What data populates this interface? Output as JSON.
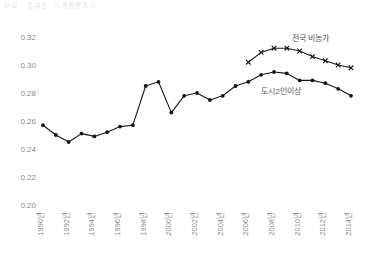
{
  "top_strip": {
    "text": "자료 : 통계청, 가계동향조사"
  },
  "chart_data": {
    "type": "line",
    "title": "",
    "xlabel": "",
    "ylabel": "",
    "ylim": [
      0.2,
      0.32
    ],
    "yticks": [
      0.2,
      0.22,
      0.24,
      0.26,
      0.28,
      0.3,
      0.32
    ],
    "ytick_labels": [
      "0.20",
      "0.22",
      "0.24",
      "0.26",
      "0.28",
      "0.30",
      "0.32"
    ],
    "x": [
      1990,
      1991,
      1992,
      1993,
      1994,
      1995,
      1996,
      1997,
      1998,
      1999,
      2000,
      2001,
      2002,
      2003,
      2004,
      2005,
      2006,
      2007,
      2008,
      2009,
      2010,
      2011,
      2012,
      2013,
      2014
    ],
    "xticks": [
      1990,
      1992,
      1994,
      1996,
      1998,
      2000,
      2002,
      2004,
      2006,
      2008,
      2010,
      2012,
      2014
    ],
    "xtick_labels": [
      "1990년",
      "1992년",
      "1994년",
      "1996년",
      "1998년",
      "2000년",
      "2002년",
      "2004년",
      "2006년",
      "2008년",
      "2010년",
      "2012년",
      "2014년"
    ],
    "grid": false,
    "legend_position": "inline-annotation",
    "series": [
      {
        "name": "도시2인이상",
        "marker": "circle",
        "annotation_x": 2007,
        "annotation_y": 0.2795,
        "x": [
          1990,
          1991,
          1992,
          1993,
          1994,
          1995,
          1996,
          1997,
          1998,
          1999,
          2000,
          2001,
          2002,
          2003,
          2004,
          2005,
          2006,
          2007,
          2008,
          2009,
          2010,
          2011,
          2012,
          2013,
          2014
        ],
        "values": [
          0.257,
          0.25,
          0.245,
          0.251,
          0.249,
          0.252,
          0.256,
          0.257,
          0.285,
          0.288,
          0.266,
          0.278,
          0.28,
          0.275,
          0.278,
          0.285,
          0.288,
          0.293,
          0.295,
          0.294,
          0.289,
          0.289,
          0.287,
          0.283,
          0.278
        ]
      },
      {
        "name": "전국 비농가",
        "marker": "cross",
        "annotation_x": 2009.4,
        "annotation_y": 0.3175,
        "x": [
          2006,
          2007,
          2008,
          2009,
          2010,
          2011,
          2012,
          2013,
          2014
        ],
        "values": [
          0.302,
          0.309,
          0.312,
          0.312,
          0.31,
          0.306,
          0.303,
          0.3,
          0.298
        ]
      }
    ]
  },
  "colors": {
    "line": "#141414",
    "tick_text": "#8a8a8a",
    "annotation_text": "#5a5a5a",
    "background": "#ffffff"
  }
}
